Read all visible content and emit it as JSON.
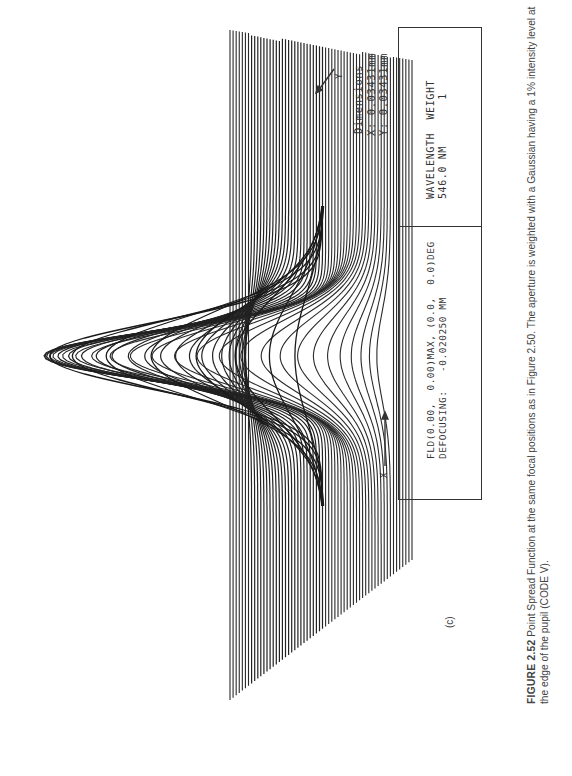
{
  "figure": {
    "panel_label": "(c)",
    "caption": {
      "number": "FIGURE 2.52",
      "text": " Point Spread Function at the same focal positions as in Figure 2.50. The aperture is weighted with a Gaussian having a 1% intensity level at the edge of the pupil (CODE V)."
    },
    "dimensions": {
      "title": "Dimensions",
      "x_line": "X: 0.03431mm",
      "y_line": "Y: 0.03431mm"
    },
    "info_box": {
      "field_line": "FLD(0.00,  0.00)MAX, (0.0,  0.0)DEG",
      "defocus_line": "DEFOCUSING:   -0.020250 MM",
      "wavelength_header": "WAVELENGTH  WEIGHT",
      "wavelength_value": "546.0 NM       1"
    },
    "axes": {
      "x_label": "X",
      "y_label": "Y"
    }
  },
  "chart_data": {
    "type": "surface",
    "xlabel": "X",
    "ylabel": "Y",
    "x_extent_mm": 0.03431,
    "y_extent_mm": 0.03431,
    "wavelength_nm": 546.0,
    "wavelength_weight": 1,
    "field": "FLD(0.00, 0.00) MAX, (0.0, 0.0) DEG",
    "defocusing_mm": -0.02025,
    "grid_lines_approx": 60,
    "peak_relative_height": 1.0
  }
}
